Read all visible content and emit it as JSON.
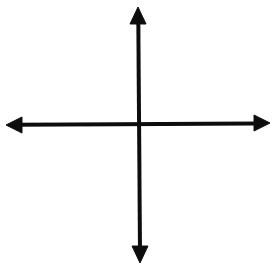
{
  "diagram": {
    "type": "coordinate-axes",
    "stroke_color": "#111111",
    "background": "#ffffff",
    "axes": {
      "horizontal": {
        "x1": 6,
        "y1": 125,
        "x2": 270,
        "y2": 123,
        "arrows": "both"
      },
      "vertical": {
        "x1": 138,
        "y1": 7,
        "x2": 140,
        "y2": 263,
        "arrows": "both"
      }
    },
    "labels": []
  }
}
